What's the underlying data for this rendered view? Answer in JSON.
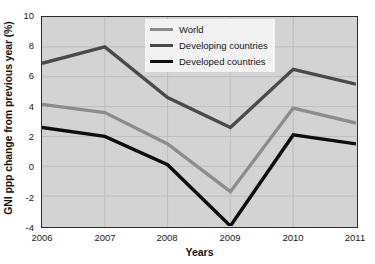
{
  "chart_data": {
    "type": "line",
    "title": "",
    "xlabel": "Years",
    "ylabel": "GNI ppp change from previous year (%)",
    "x": [
      "2006",
      "2007",
      "2008",
      "2009",
      "2010",
      "2011"
    ],
    "categories": [
      "2006",
      "2007",
      "2008",
      "2009",
      "2010",
      "2011"
    ],
    "xlim": [
      2006,
      2011
    ],
    "ylim": [
      -4,
      10
    ],
    "yticks": [
      10,
      8,
      6,
      4,
      2,
      0,
      -2,
      -4
    ],
    "ytick_labels": [
      "10",
      "8",
      "6",
      "4",
      "2",
      "0",
      "-2",
      "-4"
    ],
    "xticks": [
      "2006",
      "2007",
      "2008",
      "2009",
      "2010",
      "2011"
    ],
    "grid": true,
    "grid_style": "both axes, light gray lines",
    "legend_position": "top-center-right inside plot",
    "series": [
      {
        "name": "World",
        "color": "#8c8c8c",
        "values": [
          4.15,
          3.6,
          1.5,
          -1.7,
          3.9,
          2.9
        ]
      },
      {
        "name": "Developing countries",
        "color": "#4a4a4a",
        "values": [
          6.9,
          8.0,
          4.6,
          2.6,
          6.5,
          5.5
        ]
      },
      {
        "name": "Developed countries",
        "color": "#0d0d0d",
        "values": [
          2.6,
          2.0,
          0.1,
          -4.0,
          2.1,
          1.5
        ]
      }
    ]
  },
  "legend": {
    "items": [
      {
        "label": "World"
      },
      {
        "label": "Developing countries"
      },
      {
        "label": "Developed countries"
      }
    ]
  },
  "colors": {
    "plot_background": "#d3d3d3",
    "page_background": "#ffffff",
    "axis": "#2a2a2a",
    "grid": "#bdbdbd",
    "world": "#8c8c8c",
    "developing": "#4a4a4a",
    "developed": "#0d0d0d",
    "legend_background": "#f2f2f2"
  }
}
